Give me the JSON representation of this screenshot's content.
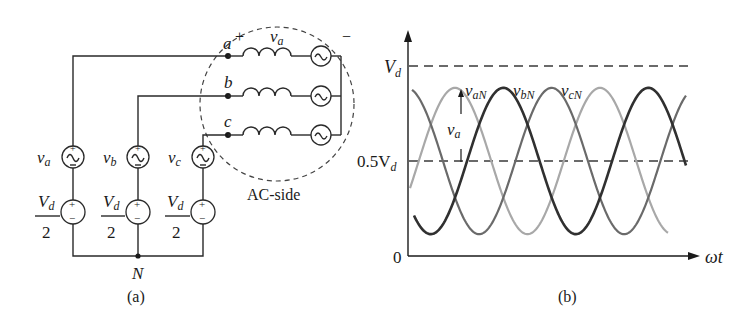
{
  "figure_a": {
    "caption": "(a)",
    "nodes": {
      "a": "a",
      "b": "b",
      "c": "c",
      "N": "N"
    },
    "inductor_voltage": {
      "symbol": "v",
      "subscript": "a",
      "plus": "+",
      "minus": "−"
    },
    "ac_side_label": "AC-side",
    "sources": [
      {
        "symbol": "v",
        "subscript": "a",
        "dc_num": "V",
        "dc_num_sub": "d",
        "dc_den": "2"
      },
      {
        "symbol": "v",
        "subscript": "b",
        "dc_num": "V",
        "dc_num_sub": "d",
        "dc_den": "2"
      },
      {
        "symbol": "v",
        "subscript": "c",
        "dc_num": "V",
        "dc_num_sub": "d",
        "dc_den": "2"
      }
    ],
    "plus_sign": "+",
    "minus_sign": "−"
  },
  "figure_b": {
    "caption": "(b)",
    "y_ticks": {
      "top": {
        "main": "V",
        "sub": "d"
      },
      "mid": {
        "main": "0.5V",
        "sub": "d"
      },
      "zero": "0"
    },
    "x_axis_label": "ωt",
    "curve_labels": [
      {
        "main": "v",
        "sub": "aN"
      },
      {
        "main": "v",
        "sub": "bN"
      },
      {
        "main": "v",
        "sub": "cN"
      }
    ],
    "annotation": {
      "main": "v",
      "sub": "a"
    }
  },
  "chart_data": {
    "type": "line",
    "title": "",
    "xlabel": "ωt",
    "ylabel": "",
    "y_ticks": [
      "0",
      "0.5Vd",
      "Vd"
    ],
    "ylim": [
      0,
      1.0
    ],
    "y_units": "Vd",
    "reference_lines": [
      {
        "y": 1.0,
        "style": "dashed",
        "label": "Vd"
      },
      {
        "y": 0.5,
        "style": "dashed",
        "label": "0.5Vd"
      }
    ],
    "series": [
      {
        "name": "vaN",
        "shade": "#a8a8a8",
        "offset": 0.5,
        "amplitude": 0.385,
        "phase_deg": 0
      },
      {
        "name": "vbN",
        "shade": "#303030",
        "offset": 0.5,
        "amplitude": 0.385,
        "phase_deg": -120
      },
      {
        "name": "vcN",
        "shade": "#6a6a6a",
        "offset": 0.5,
        "amplitude": 0.385,
        "phase_deg": -240
      }
    ],
    "cycles_shown": 2.5,
    "annotation": "va = vaN − 0.5Vd (arrow from 0.5Vd up to vaN peak)"
  }
}
